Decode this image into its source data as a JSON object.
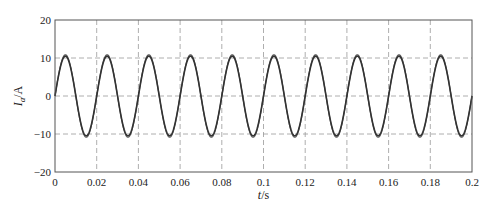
{
  "chart_data": {
    "type": "line",
    "title": "",
    "xlabel": "t/s",
    "ylabel": "I_a/A",
    "ylabel_main": "I",
    "ylabel_sub": "a",
    "ylabel_unit": "/A",
    "xlim": [
      0,
      0.2
    ],
    "ylim": [
      -20,
      20
    ],
    "grid": true,
    "grid_style": "dashed",
    "x_ticks": [
      0,
      0.02,
      0.04,
      0.06,
      0.08,
      0.1,
      0.12,
      0.14,
      0.16,
      0.18,
      0.2
    ],
    "x_tick_labels": [
      "0",
      "0.02",
      "0.04",
      "0.06",
      "0.08",
      "0.1",
      "0.12",
      "0.14",
      "0.16",
      "0.18",
      "0.2"
    ],
    "y_ticks": [
      -20,
      -10,
      0,
      10,
      20
    ],
    "y_tick_labels": [
      "−20",
      "−10",
      "0",
      "10",
      "20"
    ],
    "series": [
      {
        "name": "I_a",
        "kind": "sinusoid",
        "amplitude": 10.5,
        "frequency_hz": 50,
        "phase_deg": 0,
        "color": "#333333",
        "x": [
          0,
          0.005,
          0.01,
          0.015,
          0.02,
          0.025,
          0.03,
          0.035,
          0.04,
          0.045,
          0.05,
          0.055,
          0.06,
          0.065,
          0.07,
          0.075,
          0.08,
          0.085,
          0.09,
          0.095,
          0.1,
          0.105,
          0.11,
          0.115,
          0.12,
          0.125,
          0.13,
          0.135,
          0.14,
          0.145,
          0.15,
          0.155,
          0.16,
          0.165,
          0.17,
          0.175,
          0.18,
          0.185,
          0.19,
          0.195,
          0.2
        ],
        "values": [
          0,
          10.5,
          0,
          -10.5,
          0,
          10.5,
          0,
          -10.5,
          0,
          10.5,
          0,
          -10.5,
          0,
          10.5,
          0,
          -10.5,
          0,
          10.5,
          0,
          -10.5,
          0,
          10.5,
          0,
          -10.5,
          0,
          10.5,
          0,
          -10.5,
          0,
          10.5,
          0,
          -10.5,
          0,
          10.5,
          0,
          -10.5,
          0,
          10.5,
          0,
          -10.5,
          0
        ]
      }
    ],
    "legend": null
  },
  "layout": {
    "plot_left": 55,
    "plot_top": 20,
    "plot_right": 472,
    "plot_bottom": 172
  }
}
